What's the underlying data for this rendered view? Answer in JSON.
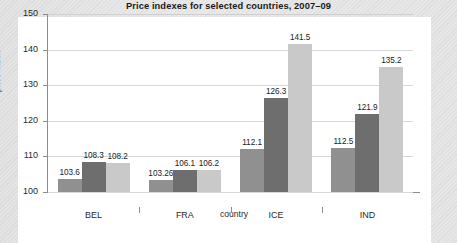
{
  "chart_data": {
    "type": "bar",
    "title": "Price indexes for selected countries, 2007–09",
    "xlabel": "country",
    "ylabel": "price index",
    "categories": [
      "BEL",
      "FRA",
      "ICE",
      "IND"
    ],
    "series": [
      {
        "name": "2007",
        "color": "#909090",
        "values": [
          103.6,
          103.26,
          112.1,
          112.5
        ]
      },
      {
        "name": "2008",
        "color": "#6e6e6e",
        "values": [
          108.3,
          106.1,
          126.3,
          121.9
        ]
      },
      {
        "name": "2009",
        "color": "#c9c9c9",
        "values": [
          108.2,
          106.2,
          141.5,
          135.2
        ]
      }
    ],
    "value_labels": [
      [
        "103.6",
        "108.3",
        "108.2"
      ],
      [
        "103.26",
        "106.1",
        "106.2"
      ],
      [
        "112.1",
        "126.3",
        "141.5"
      ],
      [
        "112.5",
        "121.9",
        "135.2"
      ]
    ],
    "ylim": [
      100,
      150
    ],
    "yticks": [
      100,
      110,
      120,
      130,
      140,
      150
    ],
    "ytick_labels": [
      "100",
      "110",
      "120",
      "130",
      "140",
      "150"
    ],
    "grid": true,
    "legend": "none",
    "colors": {
      "axis": "#8d8d8d",
      "grid": "#d7d7d7",
      "text": "#2a2a2a",
      "title": "#1b1b1b",
      "panel": "#ffffff",
      "page": "#e6e6e6"
    }
  }
}
